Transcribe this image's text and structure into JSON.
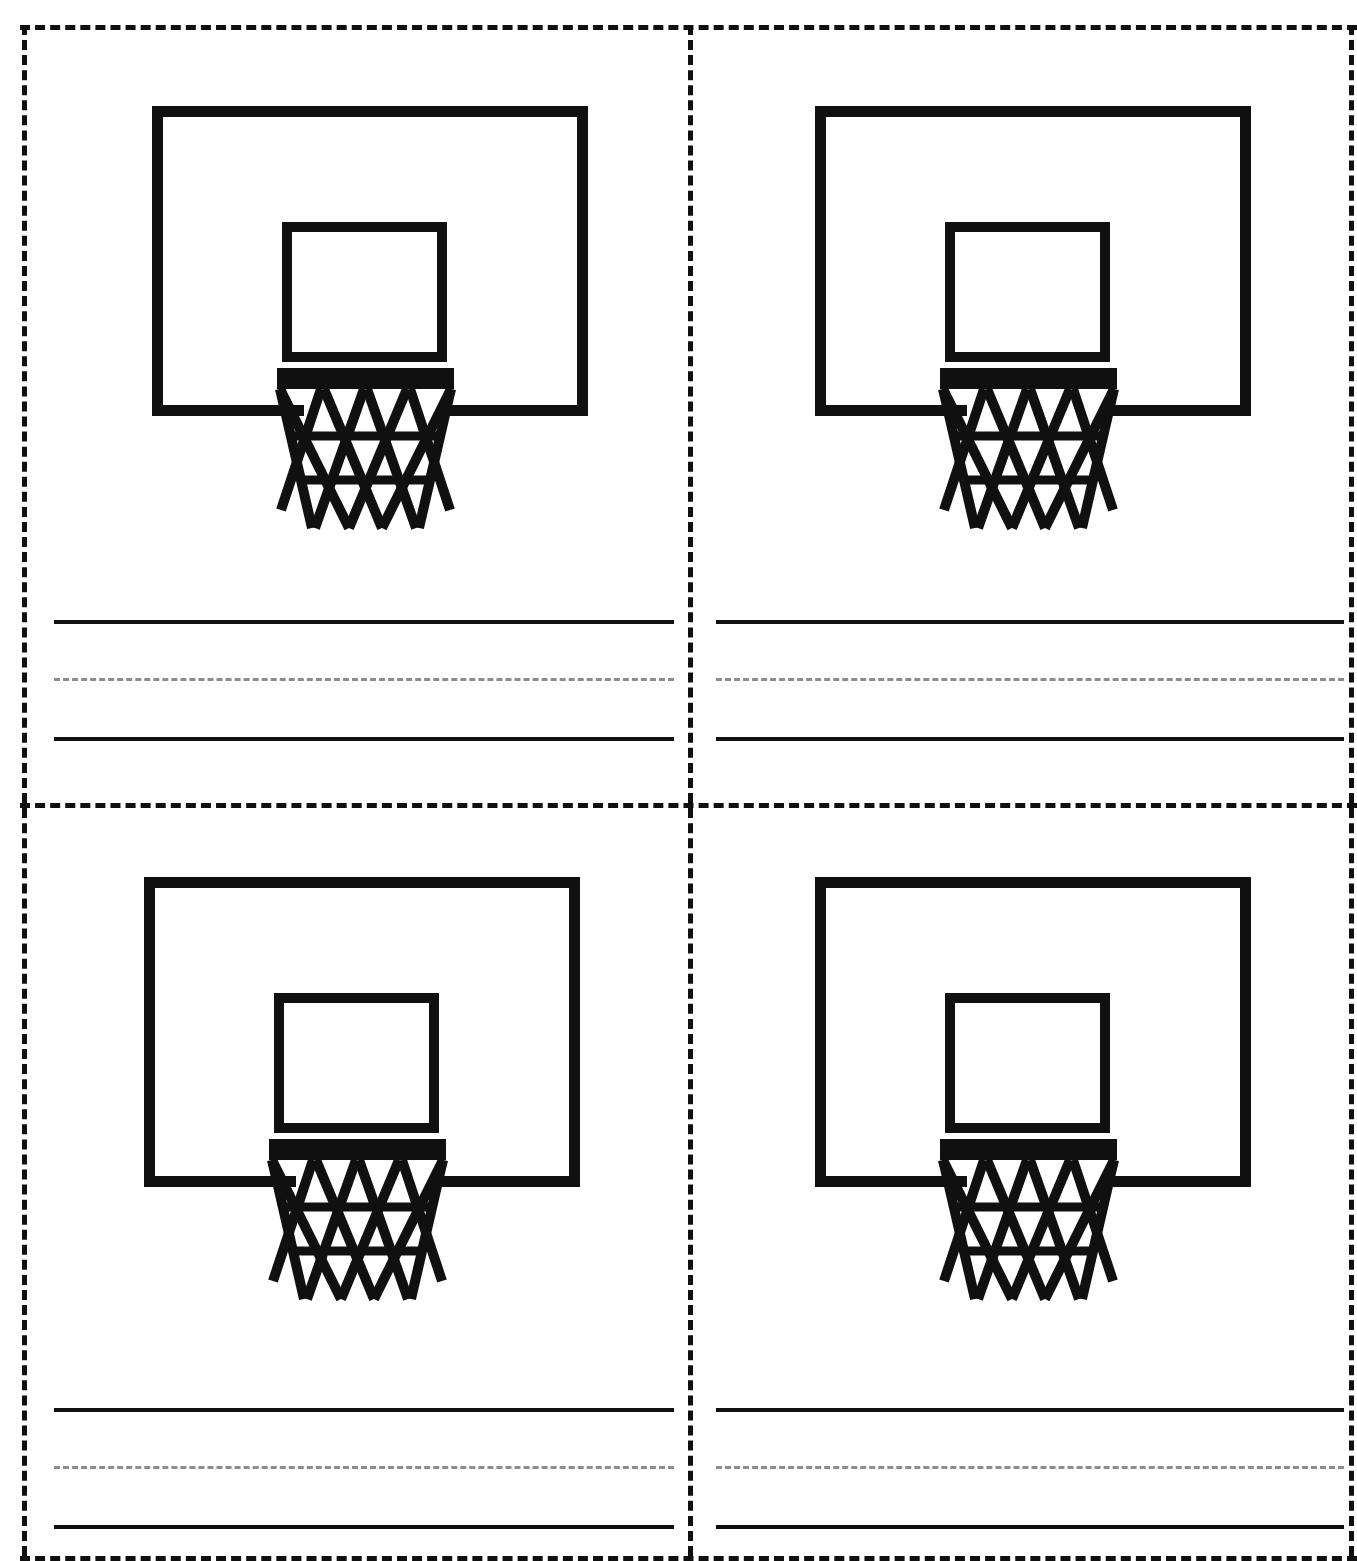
{
  "page": {
    "width": 1357,
    "height": 1560,
    "background": "#ffffff",
    "ink_color": "#101010",
    "dash_color": "#8d8d8d"
  },
  "layout": {
    "type": "grid",
    "rows": 2,
    "columns": 2,
    "cards": 4,
    "cut_lines": {
      "style": "dashed",
      "color": "#101010",
      "horizontal": [
        "top-edge",
        "mid-divider",
        "bottom-edge"
      ],
      "vertical": [
        "left-edge",
        "center-divider",
        "right-edge"
      ]
    }
  },
  "cards": [
    {
      "id": "card-top-left",
      "position": "top-left",
      "illustration": "basketball-hoop",
      "writing_lines": {
        "top": "solid",
        "middle": "dashed",
        "bottom": "solid",
        "count": 3
      }
    },
    {
      "id": "card-top-right",
      "position": "top-right",
      "illustration": "basketball-hoop",
      "writing_lines": {
        "top": "solid",
        "middle": "dashed",
        "bottom": "solid",
        "count": 3
      }
    },
    {
      "id": "card-bottom-left",
      "position": "bottom-left",
      "illustration": "basketball-hoop",
      "writing_lines": {
        "top": "solid",
        "middle": "dashed",
        "bottom": "solid",
        "count": 3
      }
    },
    {
      "id": "card-bottom-right",
      "position": "bottom-right",
      "illustration": "basketball-hoop",
      "writing_lines": {
        "top": "solid",
        "middle": "dashed",
        "bottom": "solid",
        "count": 3
      }
    }
  ],
  "illustration": {
    "name": "basketball-hoop",
    "parts": [
      "backboard-outline",
      "inner-shooting-square",
      "rim-bar",
      "net-lattice"
    ],
    "style": "black line art, no fill",
    "net_diamond_columns": 4,
    "net_diamond_rows": 3
  }
}
